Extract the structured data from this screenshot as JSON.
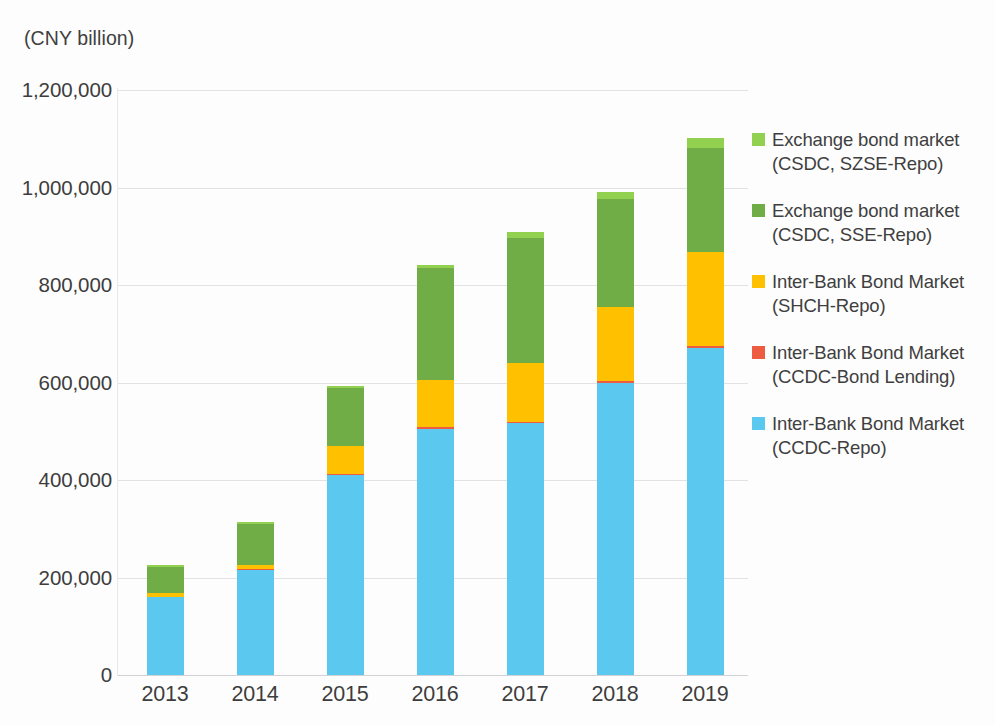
{
  "unit_label": "(CNY billion)",
  "colors": {
    "exchange_szse": "#92d050",
    "exchange_sse": "#70ad47",
    "shch_repo": "#ffc000",
    "ccdc_bond_lending": "#ed5c40",
    "ccdc_repo": "#5bc8f0",
    "gridline": "#e2e2e6",
    "text": "#3f3f3f"
  },
  "axes": {
    "y_ticks": [
      "1,200,000",
      "1,000,000",
      "800,000",
      "600,000",
      "400,000",
      "200,000",
      "0"
    ],
    "x_ticks": [
      "2013",
      "2014",
      "2015",
      "2016",
      "2017",
      "2018",
      "2019"
    ]
  },
  "legend": {
    "items": [
      {
        "color_key": "exchange_szse",
        "line1": "Exchange bond market",
        "line2": "(CSDC, SZSE-Repo)"
      },
      {
        "color_key": "exchange_sse",
        "line1": "Exchange bond market",
        "line2": "(CSDC, SSE-Repo)"
      },
      {
        "color_key": "shch_repo",
        "line1": "Inter-Bank Bond Market",
        "line2": "(SHCH-Repo)"
      },
      {
        "color_key": "ccdc_bond_lending",
        "line1": "Inter-Bank Bond Market",
        "line2": "(CCDC-Bond Lending)"
      },
      {
        "color_key": "ccdc_repo",
        "line1": "Inter-Bank Bond Market",
        "line2": "(CCDC-Repo)"
      }
    ]
  },
  "chart_data": {
    "type": "bar",
    "stacked": true,
    "title": "",
    "xlabel": "",
    "ylabel": "(CNY billion)",
    "ylim": [
      0,
      1200000
    ],
    "ytick_step": 200000,
    "grid": true,
    "legend_position": "right",
    "categories": [
      "2013",
      "2014",
      "2015",
      "2016",
      "2017",
      "2018",
      "2019"
    ],
    "series": [
      {
        "name": "Inter-Bank Bond Market (CCDC-Repo)",
        "color": "#5bc8f0",
        "values": [
          160000,
          215000,
          410000,
          505000,
          516000,
          600000,
          670000
        ]
      },
      {
        "name": "Inter-Bank Bond Market (CCDC-Bond Lending)",
        "color": "#ed5c40",
        "values": [
          1000,
          1500,
          2000,
          3000,
          3500,
          4000,
          5000
        ]
      },
      {
        "name": "Inter-Bank Bond Market (SHCH-Repo)",
        "color": "#ffc000",
        "values": [
          7000,
          9000,
          58000,
          97000,
          121000,
          151000,
          193000
        ]
      },
      {
        "name": "Exchange bond market (CSDC, SSE-Repo)",
        "color": "#70ad47",
        "values": [
          54000,
          84000,
          118000,
          229000,
          255000,
          222000,
          214000
        ]
      },
      {
        "name": "Exchange bond market (CSDC, SZSE-Repo)",
        "color": "#92d050",
        "values": [
          3000,
          5000,
          5000,
          8000,
          14000,
          13000,
          20000
        ]
      }
    ],
    "totals": [
      225000,
      314500,
      593000,
      842000,
      909500,
      990000,
      1102000
    ]
  }
}
